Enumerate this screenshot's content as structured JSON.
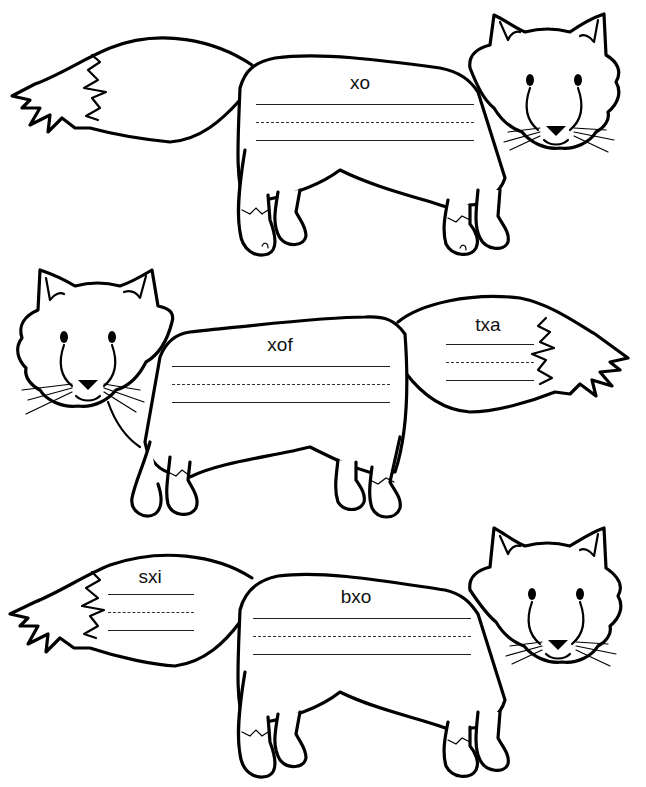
{
  "worksheet": {
    "foxes": [
      {
        "id": "fox-1",
        "facing": "right",
        "labels": [
          {
            "region": "body",
            "text": "xo"
          }
        ]
      },
      {
        "id": "fox-2",
        "facing": "left",
        "labels": [
          {
            "region": "body",
            "text": "xof"
          },
          {
            "region": "tail",
            "text": "txa"
          }
        ]
      },
      {
        "id": "fox-3",
        "facing": "right",
        "labels": [
          {
            "region": "tail",
            "text": "sxi"
          },
          {
            "region": "body",
            "text": "bxo"
          }
        ]
      }
    ],
    "colors": {
      "ink": "#000000",
      "paper": "#ffffff"
    }
  }
}
